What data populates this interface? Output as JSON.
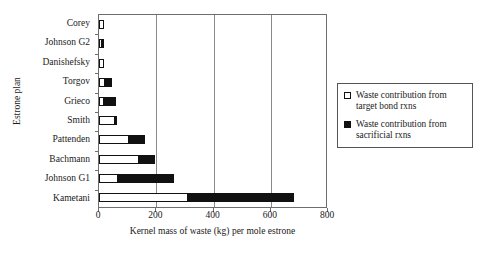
{
  "chart_data": {
    "type": "bar",
    "orientation": "horizontal",
    "stacked": true,
    "title": "",
    "xlabel": "Kernel mass of waste (kg) per mole estrone",
    "ylabel": "Estrone plan",
    "xlim": [
      0,
      800
    ],
    "xticks": [
      0,
      200,
      400,
      600,
      800
    ],
    "xtick_labels": [
      "0",
      "200",
      "400",
      "600",
      "800"
    ],
    "grid": "vertical",
    "legend_position": "right",
    "categories": [
      "Corey",
      "Johnson G2",
      "Danishefsky",
      "Torgov",
      "Grieco",
      "Smith",
      "Pattenden",
      "Bachmann",
      "Johnson G1",
      "Kametani"
    ],
    "series": [
      {
        "name": "Waste contribution from target bond rxns",
        "color": "#ffffff",
        "values": [
          17,
          10,
          17,
          20,
          18,
          55,
          105,
          140,
          68,
          312
        ]
      },
      {
        "name": "Waste contribution from sacrificial rxns",
        "color": "#111111",
        "values": [
          0,
          10,
          0,
          28,
          45,
          8,
          58,
          60,
          198,
          372
        ]
      }
    ],
    "totals": [
      17,
      20,
      17,
      48,
      63,
      63,
      163,
      200,
      266,
      684
    ]
  },
  "legend": {
    "items": [
      {
        "swatch": "open-square",
        "line1": "Waste contribution from",
        "line2": "target bond rxns"
      },
      {
        "swatch": "filled-square",
        "line1": "Waste contribution from",
        "line2": "sacrificial rxns"
      }
    ]
  }
}
